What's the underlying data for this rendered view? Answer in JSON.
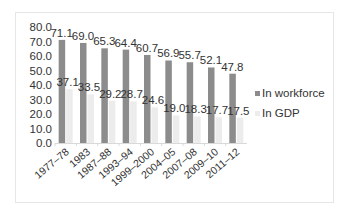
{
  "chart_data": {
    "type": "bar",
    "title": "",
    "xlabel": "",
    "ylabel": "",
    "ylim": [
      0,
      80
    ],
    "yticks": [
      "0.0",
      "10.0",
      "20.0",
      "30.0",
      "40.0",
      "50.0",
      "60.0",
      "70.0",
      "80.0"
    ],
    "grid": false,
    "legend_position": "right",
    "categories": [
      "1977–78",
      "1983",
      "1987–88",
      "1993–94",
      "1999–2000",
      "2004–05",
      "2007–08",
      "2009–10",
      "2011–12"
    ],
    "series": [
      {
        "name": "In workforce",
        "color": "#8c8c8c",
        "values": [
          71.1,
          69.0,
          65.3,
          64.4,
          60.7,
          56.9,
          55.7,
          52.1,
          47.8
        ],
        "labels": [
          "71.1",
          "69.0",
          "65.3",
          "64.4",
          "60.7",
          "56.9",
          "55.7",
          "52.1",
          "47.8"
        ]
      },
      {
        "name": "In GDP",
        "color": "#ececec",
        "values": [
          37.1,
          33.5,
          29.2,
          28.7,
          24.6,
          19.0,
          18.3,
          17.7,
          17.5
        ],
        "labels": [
          "37.1",
          "33.5",
          "29.2",
          "28.7",
          "24.6",
          "19.0",
          "18.3",
          "17.7",
          "17.5"
        ]
      }
    ]
  }
}
